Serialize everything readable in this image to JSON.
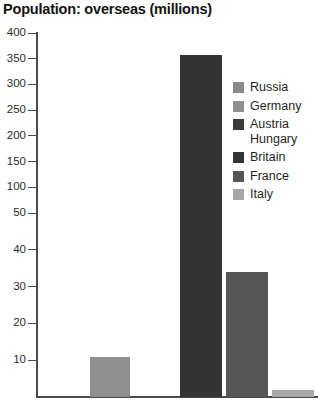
{
  "chart_data": {
    "type": "bar",
    "title": "Population: overseas (millions)",
    "xlabel": "",
    "ylabel": "",
    "categories": [
      "Russia",
      "Germany",
      "Austria Hungary",
      "Britain",
      "France",
      "Italy"
    ],
    "values": [
      0,
      11,
      0,
      358,
      34,
      2
    ],
    "series": [
      {
        "name": "Population: overseas (millions)",
        "values": [
          0,
          11,
          0,
          358,
          34,
          2
        ]
      }
    ],
    "bar_colors": [
      "#8a8a8a",
      "#8f8f8f",
      "#3a3a3a",
      "#333333",
      "#565656",
      "#a8a8a8"
    ],
    "ylim": [
      0,
      400
    ],
    "yticks": [
      10,
      20,
      30,
      40,
      50,
      100,
      150,
      200,
      250,
      300,
      350,
      400
    ],
    "ytick_labels": [
      "10",
      "20",
      "30",
      "40",
      "50",
      "100",
      "150",
      "200",
      "250",
      "300",
      "350",
      "400"
    ],
    "axis_note": "broken / dual-scale y-axis: 0-50 expanded below, 50-400 compressed above",
    "grid": false,
    "legend_position": "inside-right",
    "legend": [
      {
        "label": "Russia",
        "color": "#8a8a8a"
      },
      {
        "label": "Germany",
        "color": "#8f8f8f"
      },
      {
        "label": "Austria\nHungary",
        "color": "#3a3a3a"
      },
      {
        "label": "Britain",
        "color": "#333333"
      },
      {
        "label": "France",
        "color": "#565656"
      },
      {
        "label": "Italy",
        "color": "#a8a8a8"
      }
    ]
  },
  "axis": {
    "line_color": "#4a4a4a",
    "tick_color": "#4a4a4a",
    "label_color": "#2b2b2b"
  }
}
